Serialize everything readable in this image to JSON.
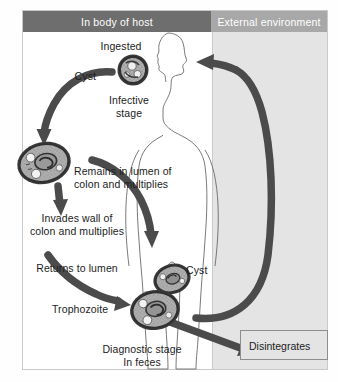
{
  "diagram": {
    "panels": {
      "host": {
        "header": "In body of host",
        "header_bg": "#6e6e6e"
      },
      "environment": {
        "header": "External environment",
        "header_bg": "#a8a8a8"
      }
    },
    "labels": {
      "ingested": "Ingested",
      "cyst_top": "Cyst",
      "infective_stage": "Infective\nstage",
      "remains_lumen": "Remains in lumen of\ncolon and multiplies",
      "invades_wall": "Invades wall of\ncolon and multiplies",
      "returns_lumen": "Returns to lumen",
      "cyst_bottom": "Cyst",
      "trophozoite": "Trophozoite",
      "diagnostic_stage": "Diagnostic stage\nIn feces",
      "disintegrates": "Disintegrates"
    },
    "organisms": [
      {
        "name": "cyst-ingested",
        "stage": "cyst",
        "shape": "round",
        "position": "top-center"
      },
      {
        "name": "trophozoite-invading",
        "stage": "trophozoite",
        "shape": "oval",
        "position": "mid-left"
      },
      {
        "name": "cyst-feces",
        "stage": "cyst",
        "shape": "oval",
        "position": "bottom-center-upper"
      },
      {
        "name": "trophozoite-feces",
        "stage": "trophozoite",
        "shape": "oval",
        "position": "bottom-center-lower"
      }
    ],
    "arrows": [
      {
        "name": "arrow-cyst-to-trophozoite",
        "direction": "down-left",
        "style": "curved-thick"
      },
      {
        "name": "arrow-trophozoite-down",
        "direction": "down",
        "style": "straight-thick"
      },
      {
        "name": "arrow-remains-in-lumen",
        "direction": "down-right",
        "style": "curved-thick"
      },
      {
        "name": "arrow-returns-to-lumen",
        "direction": "down-right",
        "style": "curved-thick"
      },
      {
        "name": "arrow-feces-to-environment",
        "direction": "right",
        "style": "straight-thick"
      },
      {
        "name": "arrow-environment-loop-up",
        "direction": "up-right",
        "style": "curved-thick"
      },
      {
        "name": "arrow-environment-to-mouth",
        "direction": "left",
        "style": "curved-thick"
      },
      {
        "name": "arrow-to-disintegrates",
        "direction": "right",
        "style": "straight-thick"
      }
    ],
    "colors": {
      "arrow": "#4b4b4b",
      "panel_host_bg": "#ffffff",
      "panel_env_bg": "#e4e4e4",
      "body_fill": "#ffffff",
      "text": "#1c1c1c"
    }
  }
}
